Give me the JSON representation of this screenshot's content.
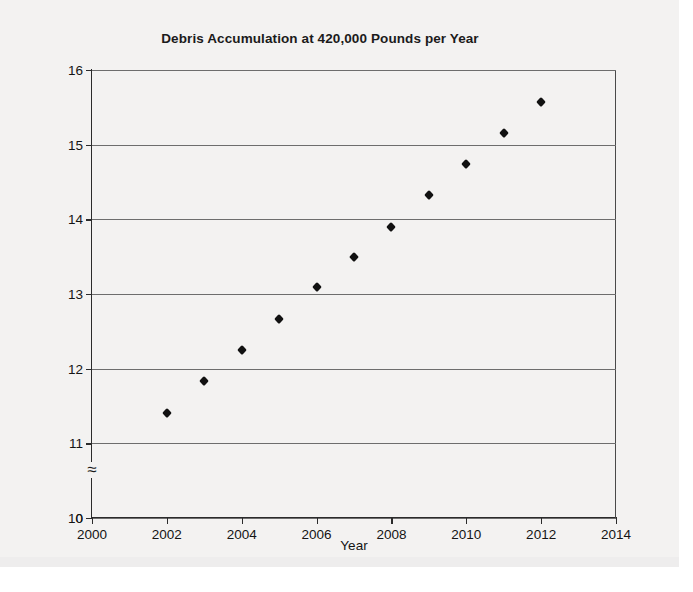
{
  "chart_data": {
    "type": "scatter",
    "title": "Debris Accumulation at 420,000 Pounds per Year",
    "xlabel": "Year",
    "ylabel": "Millions of Pounds",
    "xlim": [
      2000,
      2014
    ],
    "ylim": [
      10,
      16
    ],
    "y_axis_break": true,
    "y_axis_break_symbol": "≈",
    "y_zero_label": "0",
    "grid": "horizontal",
    "legend": "none",
    "xticks": [
      "2000",
      "2002",
      "2004",
      "2006",
      "2008",
      "2010",
      "2012",
      "2014"
    ],
    "yticks": [
      "0",
      "10",
      "11",
      "12",
      "13",
      "14",
      "15",
      "16"
    ],
    "marker": "diamond",
    "marker_color": "#111111",
    "x": [
      2002,
      2003,
      2004,
      2005,
      2006,
      2007,
      2008,
      2009,
      2010,
      2011,
      2012
    ],
    "values": [
      11.41,
      11.83,
      12.25,
      12.67,
      13.09,
      13.5,
      13.9,
      14.32,
      14.74,
      15.16,
      15.57
    ],
    "points": [
      {
        "x": 2002,
        "y": 11.41
      },
      {
        "x": 2003,
        "y": 11.83
      },
      {
        "x": 2004,
        "y": 12.25
      },
      {
        "x": 2005,
        "y": 12.67
      },
      {
        "x": 2006,
        "y": 13.09
      },
      {
        "x": 2007,
        "y": 13.5
      },
      {
        "x": 2008,
        "y": 13.9
      },
      {
        "x": 2009,
        "y": 14.32
      },
      {
        "x": 2010,
        "y": 14.74
      },
      {
        "x": 2011,
        "y": 15.16
      },
      {
        "x": 2012,
        "y": 15.57
      }
    ]
  }
}
